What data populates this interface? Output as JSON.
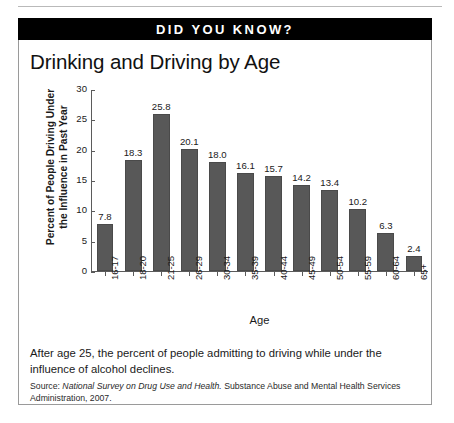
{
  "banner": {
    "text": "DID YOU KNOW?"
  },
  "chart_data": {
    "type": "bar",
    "title": "Drinking and Driving by Age",
    "xlabel": "Age",
    "ylabel": "Percent of People Driving Under the Influence in Past Year",
    "ylabel_line1": "Percent of People Driving Under",
    "ylabel_line2": "the Influence in Past Year",
    "categories": [
      "16-17",
      "18-20",
      "21-25",
      "26-29",
      "30-34",
      "35-39",
      "40-44",
      "45-49",
      "50-54",
      "55-59",
      "60-64",
      "65+"
    ],
    "values": [
      7.8,
      18.3,
      25.8,
      20.1,
      18.0,
      16.1,
      15.7,
      14.2,
      13.4,
      10.2,
      6.3,
      2.4
    ],
    "value_labels": [
      "7.8",
      "18.3",
      "25.8",
      "20.1",
      "18.0",
      "16.1",
      "15.7",
      "14.2",
      "13.4",
      "10.2",
      "6.3",
      "2.4"
    ],
    "ylim": [
      0,
      30
    ],
    "yticks": [
      0,
      5,
      10,
      15,
      20,
      25,
      30
    ],
    "ytick_labels": [
      "0",
      "5",
      "10",
      "15",
      "20",
      "25",
      "30"
    ],
    "grid": false,
    "legend": "none",
    "bar_color": "#585858"
  },
  "footer": {
    "caption": "After age 25, the percent of people admitting to driving while under the influence of alcohol declines.",
    "source_prefix": "Source: ",
    "source_italic": "National Survey on Drug Use and Health.",
    "source_rest": " Substance Abuse and Mental Health Services Administration, 2007."
  }
}
